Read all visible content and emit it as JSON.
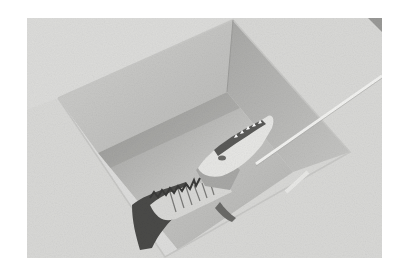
{
  "image": {
    "description": "Black-and-white photograph of an alligator lying in a square concrete pit, with a long pole reaching into the pit toward its head",
    "colors": {
      "background": "#ffffff",
      "ground": "#d6d6d4",
      "wall_left": "#c4c4c2",
      "wall_right": "#b2b2b0",
      "floor": "#bdbdbb",
      "shadow": "#8e8e8c",
      "alligator_dark": "#4a4a48",
      "alligator_light": "#e6e6e4",
      "pole": "#efefed"
    },
    "subjects": [
      "concrete-pit",
      "alligator",
      "pole"
    ]
  }
}
